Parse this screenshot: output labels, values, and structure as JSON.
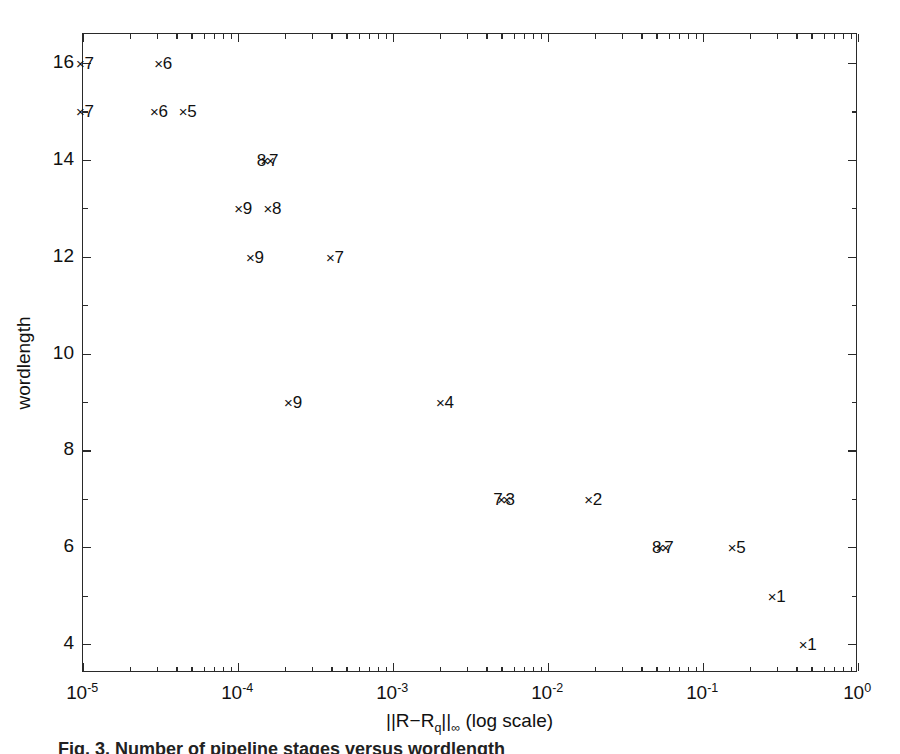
{
  "figure": {
    "caption": "Fig. 3. Number of pipeline stages versus wordlength"
  },
  "chart_data": {
    "type": "scatter",
    "title": "",
    "xlabel": "||R−Rₐ||∞ (log scale)",
    "xlabel_parts": {
      "prefix": "||R−R",
      "sub": "q",
      "mid": "||",
      "inf": "∞",
      "suffix": " (log scale)"
    },
    "ylabel": "wordlength",
    "xscale": "log",
    "yscale": "linear",
    "xlim": [
      1e-05,
      1
    ],
    "ylim": [
      3.4,
      16.6
    ],
    "grid": false,
    "legend": null,
    "xticks": [
      {
        "value": 1e-05,
        "mantissa": "10",
        "exponent": "-5"
      },
      {
        "value": 0.0001,
        "mantissa": "10",
        "exponent": "-4"
      },
      {
        "value": 0.001,
        "mantissa": "10",
        "exponent": "-3"
      },
      {
        "value": 0.01,
        "mantissa": "10",
        "exponent": "-2"
      },
      {
        "value": 0.1,
        "mantissa": "10",
        "exponent": "-1"
      },
      {
        "value": 1,
        "mantissa": "10",
        "exponent": "0"
      }
    ],
    "yticks_major": [
      4,
      6,
      8,
      10,
      12,
      14,
      16
    ],
    "yticks_minor": [
      5,
      7,
      9,
      11,
      13,
      15
    ],
    "marker": "x",
    "point_label_note": "each point is annotated with a number",
    "points": [
      {
        "x": 1e-05,
        "y": 16,
        "label": "7",
        "label_side": "right"
      },
      {
        "x": 3.2e-05,
        "y": 16,
        "label": "6",
        "label_side": "right"
      },
      {
        "x": 1e-05,
        "y": 15,
        "label": "7",
        "label_side": "right"
      },
      {
        "x": 3e-05,
        "y": 15,
        "label": "6",
        "label_side": "right"
      },
      {
        "x": 4.6e-05,
        "y": 15,
        "label": "5",
        "label_side": "right"
      },
      {
        "x": 0.000155,
        "y": 14,
        "label": "8",
        "label_side": "left"
      },
      {
        "x": 0.000155,
        "y": 14,
        "label": "7",
        "label_side": "right"
      },
      {
        "x": 0.000105,
        "y": 13,
        "label": "9",
        "label_side": "right"
      },
      {
        "x": 0.000162,
        "y": 13,
        "label": "8",
        "label_side": "right"
      },
      {
        "x": 0.000125,
        "y": 12,
        "label": "9",
        "label_side": "right"
      },
      {
        "x": 0.00041,
        "y": 12,
        "label": "7",
        "label_side": "right"
      },
      {
        "x": 0.00022,
        "y": 9,
        "label": "9",
        "label_side": "right"
      },
      {
        "x": 0.0021,
        "y": 9,
        "label": "4",
        "label_side": "right"
      },
      {
        "x": 0.0052,
        "y": 7,
        "label": "3",
        "label_side": "right"
      },
      {
        "x": 0.0052,
        "y": 7,
        "label": "7",
        "label_side": "left"
      },
      {
        "x": 0.019,
        "y": 7,
        "label": "2",
        "label_side": "right"
      },
      {
        "x": 0.055,
        "y": 6,
        "label": "7",
        "label_side": "right"
      },
      {
        "x": 0.055,
        "y": 6,
        "label": "8",
        "label_side": "left"
      },
      {
        "x": 0.16,
        "y": 6,
        "label": "5",
        "label_side": "right"
      },
      {
        "x": 0.29,
        "y": 5,
        "label": "1",
        "label_side": "right"
      },
      {
        "x": 0.46,
        "y": 4,
        "label": "1",
        "label_side": "right"
      }
    ]
  }
}
